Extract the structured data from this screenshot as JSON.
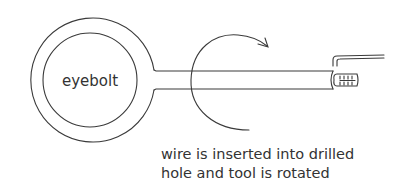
{
  "diagram": {
    "labels": {
      "eyebolt": "eyebolt",
      "caption_line1": "wire is inserted into drilled",
      "caption_line2": "hole and tool is rotated"
    },
    "parts": [
      "eyebolt-ring",
      "eyebolt-shaft",
      "rotation-arrow",
      "wire-coil",
      "bent-wire-tool"
    ],
    "colors": {
      "line": "#3a3a3a",
      "text": "#333333",
      "background": "#ffffff"
    }
  }
}
